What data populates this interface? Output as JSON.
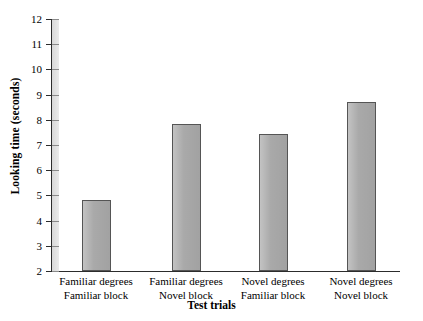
{
  "chart_data": {
    "type": "bar",
    "title": "",
    "xlabel": "Test trials",
    "ylabel": "Looking time (seconds)",
    "categories": [
      "Familiar degrees\nFamiliar block",
      "Familiar degrees\nNovel block",
      "Novel degrees\nFamiliar block",
      "Novel degrees\nNovel block"
    ],
    "category_lines": [
      [
        "Familiar degrees",
        "Familiar block"
      ],
      [
        "Familiar degrees",
        "Novel block"
      ],
      [
        "Novel degrees",
        "Familiar block"
      ],
      [
        "Novel degrees",
        "Novel block"
      ]
    ],
    "values": [
      4.8,
      7.85,
      7.45,
      8.7
    ],
    "ylim": [
      2,
      12
    ],
    "yticks": [
      2,
      3,
      4,
      5,
      6,
      7,
      8,
      9,
      10,
      11,
      12
    ],
    "ytick_labels": [
      "2",
      "3",
      "4",
      "5",
      "6",
      "7",
      "8",
      "9",
      "10",
      "11",
      "12"
    ],
    "grid": false,
    "legend": null,
    "bar_color": "#a9a9a9",
    "bar_edge_color": "#555555",
    "axis_color": "#2c2c2c",
    "background": "#ffffff"
  },
  "axes": {
    "y_title": "Looking time (seconds)",
    "x_title": "Test trials"
  }
}
